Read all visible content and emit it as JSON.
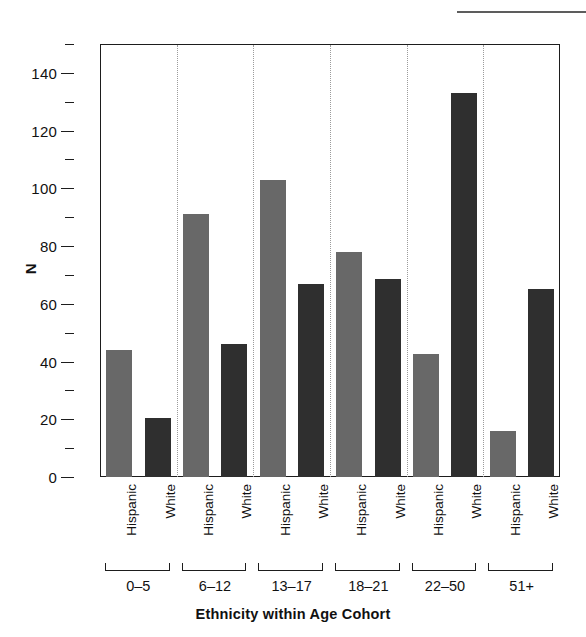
{
  "chart_data": {
    "type": "bar",
    "title": "",
    "xlabel": "Ethnicity within Age Cohort",
    "ylabel": "N",
    "categories": [
      "0–5",
      "6–12",
      "13–17",
      "18–21",
      "22–50",
      "51+"
    ],
    "series": [
      {
        "name": "Hispanic",
        "color": "#686868",
        "values": [
          44,
          91,
          103,
          78,
          42.5,
          16
        ]
      },
      {
        "name": "White",
        "color": "#2f2f2f",
        "values": [
          20.5,
          46,
          67,
          68.5,
          133,
          65
        ]
      }
    ],
    "ylim": [
      0,
      150
    ],
    "ytick_major": [
      0,
      20,
      40,
      60,
      80,
      100,
      120,
      140
    ],
    "ytick_minor": [
      10,
      30,
      50,
      70,
      90,
      110,
      130,
      150
    ],
    "ytick_labels": [
      "0",
      "20",
      "40",
      "60",
      "80",
      "100",
      "120",
      "140"
    ],
    "grid": false,
    "group_separators": true,
    "legend": "none"
  },
  "axes": {
    "y_title": "N",
    "x_title": "Ethnicity within Age Cohort"
  },
  "series_tick_labels": [
    "Hispanic",
    "White",
    "Hispanic",
    "White",
    "Hispanic",
    "White",
    "Hispanic",
    "White",
    "Hispanic",
    "White",
    "Hispanic",
    "White"
  ],
  "colors": {
    "hispanic": "#686868",
    "white": "#2f2f2f",
    "axis": "#1d1d1d",
    "separator": "#9b9b9b",
    "background": "#ffffff"
  }
}
